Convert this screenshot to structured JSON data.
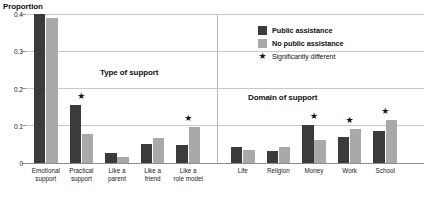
{
  "chart_data": {
    "type": "bar",
    "title": "",
    "xlabel": "",
    "ylabel": "Proportion",
    "ylim": [
      0,
      0.4
    ],
    "yticks": [
      "0",
      "0.1",
      "0.2",
      "0.3",
      "0.4"
    ],
    "ytick_values": [
      0,
      0.1,
      0.2,
      0.3,
      0.4
    ],
    "grid": true,
    "legend_position": "top-right",
    "categories": [
      "Emotional support",
      "Practical support",
      "Like a parent",
      "Like a friend",
      "Like a role model",
      "Life",
      "Religion",
      "Money",
      "Work",
      "School"
    ],
    "series": [
      {
        "name": "Public assistance",
        "color": "#3b3b3b",
        "values": [
          0.4,
          0.155,
          0.026,
          0.052,
          0.048,
          0.042,
          0.032,
          0.102,
          0.071,
          0.085
        ]
      },
      {
        "name": "No public assistance",
        "color": "#a9a9a9",
        "values": [
          0.39,
          0.078,
          0.017,
          0.066,
          0.097,
          0.035,
          0.042,
          0.063,
          0.09,
          0.116
        ]
      }
    ],
    "annotations": [
      {
        "category": "Practical support",
        "marker": "*",
        "meaning": "Significantly different"
      },
      {
        "category": "Like a role model",
        "marker": "*",
        "meaning": "Significantly different"
      },
      {
        "category": "Money",
        "marker": "*",
        "meaning": "Significantly different"
      },
      {
        "category": "Work",
        "marker": "*",
        "meaning": "Significantly different"
      },
      {
        "category": "School",
        "marker": "*",
        "meaning": "Significantly different"
      }
    ],
    "panels": [
      {
        "label": "Type of support",
        "categories": [
          "Emotional support",
          "Practical support",
          "Like a parent",
          "Like a friend",
          "Like a role model"
        ]
      },
      {
        "label": "Domain of support",
        "categories": [
          "Life",
          "Religion",
          "Money",
          "Work",
          "School"
        ]
      }
    ]
  },
  "axis": {
    "y_title": "Proportion",
    "y_ticks": [
      "0.4",
      "0.3",
      "0.2",
      "0.1",
      "0"
    ]
  },
  "panels": {
    "left_heading": "Type of support",
    "right_heading": "Domain of support"
  },
  "legend": {
    "items": [
      {
        "label": "Public assistance",
        "swatch": "dark"
      },
      {
        "label": "No public assistance",
        "swatch": "light"
      },
      {
        "label": "Significantly different",
        "swatch": "star"
      }
    ],
    "star_glyph": "★"
  },
  "categories": [
    {
      "label": "Emotional\nsupport"
    },
    {
      "label": "Practical\nsupport"
    },
    {
      "label": "Like a\nparent"
    },
    {
      "label": "Like a\nfriend"
    },
    {
      "label": "Like a\nrole model"
    },
    {
      "label": "Life"
    },
    {
      "label": "Religion"
    },
    {
      "label": "Money"
    },
    {
      "label": "Work"
    },
    {
      "label": "School"
    }
  ]
}
